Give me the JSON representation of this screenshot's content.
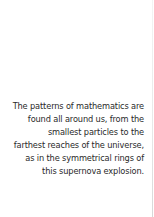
{
  "caption": {
    "lines": [
      "The patterns of mathematics are",
      "found all around us, from the",
      "smallest particles to the",
      "farthest reaches of the universe,",
      "as in the symmetrical rings of",
      "this supernova explosion."
    ]
  },
  "colors": {
    "background": "#ffffff",
    "text": "#2a2a2a"
  }
}
